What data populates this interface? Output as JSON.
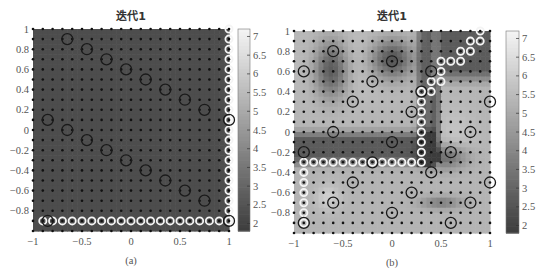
{
  "figure": {
    "panels": [
      {
        "id": "a",
        "title": "迭代1",
        "caption": "(a)"
      },
      {
        "id": "b",
        "title": "迭代1",
        "caption": "(b)"
      }
    ]
  },
  "chart_data": [
    {
      "type": "heatmap",
      "title": "迭代1",
      "caption": "(a)",
      "xlabel": "",
      "ylabel": "",
      "xlim": [
        -1,
        1
      ],
      "ylim": [
        -1,
        1
      ],
      "xticks": [
        "-1",
        "-0.5",
        "0",
        "0.5",
        "1"
      ],
      "yticks": [
        "1",
        "0.8",
        "0.6",
        "0.4",
        "0.2",
        "0",
        "-0.2",
        "-0.4",
        "-0.6",
        "-0.8"
      ],
      "colorbar": {
        "range": [
          1.8,
          7.2
        ],
        "ticks": [
          "7",
          "6.5",
          "6",
          "5.5",
          "5",
          "4.5",
          "4",
          "3.5",
          "3",
          "2.5",
          "2"
        ],
        "colormap": "gray"
      },
      "grid_points": {
        "spacing": 0.1,
        "marker": "black-dot"
      },
      "background": "uniform dark gray (~2.3)",
      "black_circles": [
        [
          -0.65,
          0.9
        ],
        [
          -0.45,
          0.8
        ],
        [
          -0.25,
          0.7
        ],
        [
          -0.05,
          0.6
        ],
        [
          0.15,
          0.5
        ],
        [
          0.35,
          0.4
        ],
        [
          0.55,
          0.3
        ],
        [
          0.75,
          0.2
        ],
        [
          -0.85,
          0.1
        ],
        [
          -0.65,
          0.0
        ],
        [
          -0.45,
          -0.1
        ],
        [
          -0.25,
          -0.2
        ],
        [
          -0.05,
          -0.3
        ],
        [
          0.15,
          -0.4
        ],
        [
          0.35,
          -0.5
        ],
        [
          0.55,
          -0.6
        ],
        [
          0.75,
          -0.7
        ],
        [
          -0.85,
          -0.9
        ],
        [
          1.0,
          0.1
        ],
        [
          1.0,
          -0.9
        ]
      ],
      "white_circles": [
        [
          1.0,
          1.0
        ],
        [
          1.0,
          0.9
        ],
        [
          1.0,
          0.8
        ],
        [
          1.0,
          0.7
        ],
        [
          1.0,
          0.6
        ],
        [
          1.0,
          0.5
        ],
        [
          1.0,
          0.4
        ],
        [
          1.0,
          0.3
        ],
        [
          1.0,
          0.2
        ],
        [
          1.0,
          0.1
        ],
        [
          1.0,
          0.0
        ],
        [
          1.0,
          -0.1
        ],
        [
          1.0,
          -0.2
        ],
        [
          1.0,
          -0.3
        ],
        [
          1.0,
          -0.4
        ],
        [
          1.0,
          -0.5
        ],
        [
          1.0,
          -0.6
        ],
        [
          1.0,
          -0.7
        ],
        [
          1.0,
          -0.8
        ],
        [
          1.0,
          -0.9
        ],
        [
          -0.9,
          -0.9
        ],
        [
          -0.8,
          -0.9
        ],
        [
          -0.7,
          -0.9
        ],
        [
          -0.6,
          -0.9
        ],
        [
          -0.5,
          -0.9
        ],
        [
          -0.4,
          -0.9
        ],
        [
          -0.3,
          -0.9
        ],
        [
          -0.2,
          -0.9
        ],
        [
          -0.1,
          -0.9
        ],
        [
          0.0,
          -0.9
        ],
        [
          0.1,
          -0.9
        ],
        [
          0.2,
          -0.9
        ],
        [
          0.3,
          -0.9
        ],
        [
          0.4,
          -0.9
        ],
        [
          0.5,
          -0.9
        ],
        [
          0.6,
          -0.9
        ],
        [
          0.7,
          -0.9
        ],
        [
          0.8,
          -0.9
        ],
        [
          0.9,
          -0.9
        ]
      ]
    },
    {
      "type": "heatmap",
      "title": "迭代1",
      "caption": "(b)",
      "xlabel": "",
      "ylabel": "",
      "xlim": [
        -1,
        1
      ],
      "ylim": [
        -1,
        1
      ],
      "xticks": [
        "-1",
        "-0.5",
        "0",
        "0.5",
        "1"
      ],
      "yticks": [
        "1",
        "0.8",
        "0.6",
        "0.4",
        "0.2",
        "0",
        "-0.2",
        "-0.4",
        "-0.6",
        "-0.8"
      ],
      "colorbar": {
        "range": [
          1.8,
          7.2
        ],
        "ticks": [
          "7",
          "6.5",
          "6",
          "5.5",
          "5",
          "4.5",
          "4",
          "3.5",
          "3",
          "2.5",
          "2"
        ],
        "colormap": "gray"
      },
      "grid_points": {
        "spacing": 0.1,
        "marker": "black-dot"
      },
      "background": "light field (~5.5) with dark blobs at (-0.6,0.6), (0,0.7); dark region upper-right and band y≈-0.1..-0.3 left of x≈0.4",
      "black_circles": [
        [
          -0.6,
          0.8
        ],
        [
          -0.9,
          0.6
        ],
        [
          0.0,
          0.7
        ],
        [
          -0.2,
          0.5
        ],
        [
          0.4,
          0.6
        ],
        [
          0.3,
          0.4
        ],
        [
          -0.4,
          0.3
        ],
        [
          0.2,
          0.2
        ],
        [
          -0.6,
          0.0
        ],
        [
          0.8,
          0.0
        ],
        [
          1.0,
          0.3
        ],
        [
          0.0,
          -0.1
        ],
        [
          -0.9,
          -0.2
        ],
        [
          0.6,
          -0.2
        ],
        [
          -0.2,
          -0.3
        ],
        [
          0.4,
          -0.4
        ],
        [
          -0.4,
          -0.5
        ],
        [
          1.0,
          -0.5
        ],
        [
          0.2,
          -0.6
        ],
        [
          -0.6,
          -0.7
        ],
        [
          0.8,
          -0.7
        ],
        [
          0.0,
          -0.8
        ],
        [
          -0.9,
          -0.9
        ],
        [
          0.6,
          -0.9
        ]
      ],
      "white_circles": [
        [
          0.9,
          1.0
        ],
        [
          0.8,
          0.9
        ],
        [
          0.9,
          0.9
        ],
        [
          0.7,
          0.8
        ],
        [
          0.8,
          0.8
        ],
        [
          0.5,
          0.7
        ],
        [
          0.6,
          0.7
        ],
        [
          0.7,
          0.7
        ],
        [
          0.5,
          0.6
        ],
        [
          0.4,
          0.5
        ],
        [
          0.5,
          0.5
        ],
        [
          0.3,
          0.4
        ],
        [
          0.4,
          0.4
        ],
        [
          0.3,
          0.3
        ],
        [
          0.3,
          0.2
        ],
        [
          0.3,
          0.1
        ],
        [
          0.3,
          0.0
        ],
        [
          0.3,
          -0.1
        ],
        [
          0.3,
          -0.2
        ],
        [
          0.3,
          -0.3
        ],
        [
          -0.9,
          -0.3
        ],
        [
          -0.8,
          -0.3
        ],
        [
          -0.7,
          -0.3
        ],
        [
          -0.6,
          -0.3
        ],
        [
          -0.5,
          -0.3
        ],
        [
          -0.4,
          -0.3
        ],
        [
          -0.3,
          -0.3
        ],
        [
          -0.2,
          -0.3
        ],
        [
          -0.1,
          -0.3
        ],
        [
          0.0,
          -0.3
        ],
        [
          0.1,
          -0.3
        ],
        [
          0.2,
          -0.3
        ],
        [
          -0.9,
          -0.4
        ],
        [
          -0.9,
          -0.5
        ],
        [
          -0.9,
          -0.6
        ],
        [
          -0.9,
          -0.7
        ],
        [
          -0.9,
          -0.8
        ],
        [
          -0.9,
          -0.9
        ]
      ]
    }
  ]
}
